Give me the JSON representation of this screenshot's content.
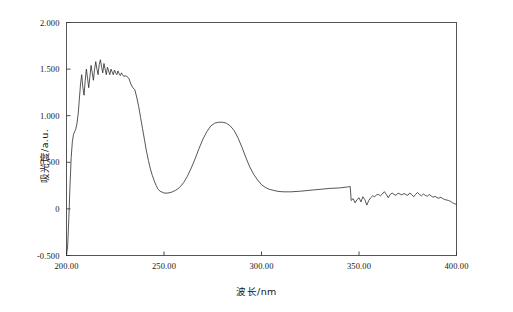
{
  "chart_data": {
    "type": "line",
    "title": "",
    "xlabel": "波长/nm",
    "ylabel": "吸光度/a.u.",
    "xlim": [
      200,
      400
    ],
    "ylim": [
      -0.5,
      2.0
    ],
    "grid": false,
    "legend": "none",
    "xticks": [
      200,
      250,
      300,
      350,
      400
    ],
    "xticklabels": [
      "200.00",
      "250.00",
      "300.00",
      "350.00",
      "400.00"
    ],
    "yticks": [
      -0.5,
      0,
      0.5,
      1.0,
      1.5,
      2.0
    ],
    "yticklabels": [
      "-0.500",
      "0",
      "0.500",
      "1.000",
      "1.500",
      "2.000"
    ],
    "line_color": "#2b2b2b",
    "line_width": 0.8,
    "series": [
      {
        "name": "absorbance",
        "x": [
          200.0,
          200.6,
          201.2,
          201.8,
          202.4,
          203.0,
          203.6,
          204.2,
          204.8,
          205.4,
          206.0,
          206.6,
          207.2,
          207.8,
          208.4,
          209.0,
          209.6,
          210.2,
          210.8,
          211.4,
          212.0,
          212.6,
          213.2,
          213.8,
          214.4,
          215.0,
          215.6,
          216.2,
          216.8,
          217.4,
          218.0,
          218.6,
          219.2,
          219.8,
          220.4,
          221.0,
          221.6,
          222.2,
          222.8,
          223.4,
          224.0,
          224.6,
          225.2,
          225.8,
          226.4,
          227.0,
          227.6,
          228.2,
          228.8,
          229.4,
          230.0,
          231.0,
          232.0,
          233.0,
          234.0,
          235.0,
          236.0,
          237.0,
          238.0,
          239.0,
          240.0,
          241.0,
          242.0,
          243.0,
          244.0,
          245.0,
          246.0,
          247.0,
          248.0,
          249.0,
          250.0,
          252.0,
          254.0,
          256.0,
          258.0,
          260.0,
          262.0,
          264.0,
          266.0,
          268.0,
          270.0,
          272.0,
          274.0,
          276.0,
          278.0,
          280.0,
          282.0,
          284.0,
          286.0,
          288.0,
          290.0,
          292.0,
          294.0,
          296.0,
          298.0,
          300.0,
          302.0,
          304.0,
          306.0,
          308.0,
          310.0,
          312.0,
          315.0,
          320.0,
          325.0,
          330.0,
          335.0,
          340.0,
          344.0,
          345.5,
          346.0,
          347.0,
          348.0,
          349.0,
          350.0,
          351.0,
          352.0,
          353.0,
          354.0,
          355.0,
          356.0,
          357.0,
          358.0,
          359.0,
          360.0,
          361.0,
          362.0,
          363.0,
          364.0,
          365.0,
          366.0,
          367.0,
          368.0,
          369.0,
          370.0,
          371.0,
          372.0,
          373.0,
          374.0,
          375.0,
          376.0,
          377.0,
          378.0,
          379.0,
          380.0,
          381.0,
          382.0,
          383.0,
          384.0,
          385.0,
          386.0,
          387.0,
          388.0,
          389.0,
          390.0,
          391.0,
          392.0,
          393.0,
          394.0,
          395.0,
          396.0,
          397.0,
          398.0,
          399.0,
          400.0
        ],
        "y": [
          -0.5,
          -0.4,
          -0.1,
          0.25,
          0.55,
          0.72,
          0.8,
          0.83,
          0.86,
          0.92,
          1.02,
          1.18,
          1.34,
          1.44,
          1.3,
          1.22,
          1.38,
          1.5,
          1.4,
          1.3,
          1.42,
          1.54,
          1.46,
          1.38,
          1.5,
          1.58,
          1.5,
          1.44,
          1.55,
          1.6,
          1.52,
          1.46,
          1.56,
          1.5,
          1.44,
          1.52,
          1.48,
          1.44,
          1.5,
          1.47,
          1.44,
          1.49,
          1.46,
          1.44,
          1.48,
          1.45,
          1.43,
          1.46,
          1.44,
          1.42,
          1.43,
          1.42,
          1.4,
          1.34,
          1.3,
          1.28,
          1.2,
          1.1,
          0.98,
          0.86,
          0.74,
          0.62,
          0.52,
          0.43,
          0.36,
          0.3,
          0.25,
          0.21,
          0.19,
          0.18,
          0.17,
          0.17,
          0.18,
          0.2,
          0.23,
          0.28,
          0.35,
          0.44,
          0.54,
          0.65,
          0.75,
          0.83,
          0.89,
          0.92,
          0.93,
          0.93,
          0.92,
          0.89,
          0.84,
          0.76,
          0.66,
          0.55,
          0.45,
          0.37,
          0.31,
          0.26,
          0.23,
          0.21,
          0.2,
          0.19,
          0.185,
          0.183,
          0.183,
          0.19,
          0.2,
          0.21,
          0.22,
          0.225,
          0.235,
          0.24,
          0.09,
          0.11,
          0.065,
          0.1,
          0.12,
          0.075,
          0.13,
          0.1,
          0.04,
          0.09,
          0.12,
          0.14,
          0.13,
          0.15,
          0.155,
          0.14,
          0.16,
          0.185,
          0.155,
          0.12,
          0.155,
          0.17,
          0.155,
          0.145,
          0.17,
          0.16,
          0.15,
          0.165,
          0.155,
          0.145,
          0.17,
          0.155,
          0.13,
          0.155,
          0.175,
          0.155,
          0.14,
          0.16,
          0.145,
          0.135,
          0.155,
          0.14,
          0.125,
          0.135,
          0.12,
          0.115,
          0.125,
          0.11,
          0.1,
          0.095,
          0.09,
          0.08,
          0.065,
          0.055,
          0.05
        ]
      }
    ]
  },
  "axes": {
    "frame_color": "#4a4a4a",
    "tick_color": "#3a3a3a"
  }
}
